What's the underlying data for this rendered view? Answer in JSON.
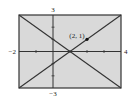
{
  "chart_data": {
    "type": "line",
    "title": "",
    "xlabel": "",
    "ylabel": "",
    "xlim": [
      -2,
      4
    ],
    "ylim": [
      -3,
      3
    ],
    "grid": false,
    "tick_labels": {
      "xmin": "−2",
      "xmax": "4",
      "ymin": "−3",
      "ymax": "3"
    },
    "x_ticks": [
      -1,
      1,
      2,
      3
    ],
    "y_ticks": [
      -2,
      -1,
      1,
      2
    ],
    "series": [
      {
        "name": "y = -x + 1",
        "x": [
          -2,
          4
        ],
        "y": [
          3,
          -3
        ]
      },
      {
        "name": "y = x - 1",
        "x": [
          -2,
          4
        ],
        "y": [
          -3,
          3
        ]
      }
    ],
    "points": [
      {
        "x": 2,
        "y": 1,
        "label": "(2, 1)"
      }
    ],
    "colors": {
      "background": "#d9d9d9",
      "frame": "#333333",
      "line": "#333333"
    }
  }
}
